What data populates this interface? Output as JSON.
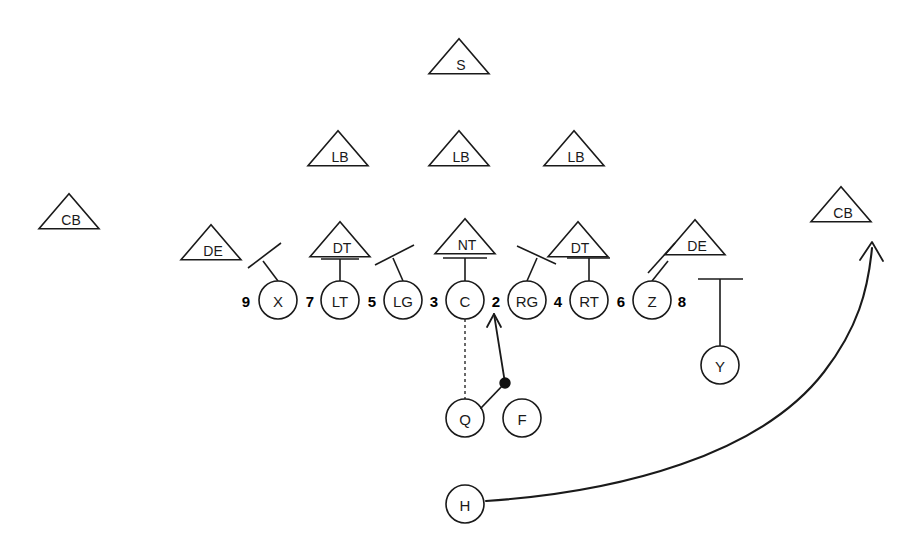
{
  "diagram": {
    "background_color": "#ffffff",
    "stroke_color": "#1a1a1a",
    "width": 924,
    "height": 550
  },
  "offense": {
    "shape": "circle",
    "players": [
      {
        "label": "X",
        "cx": 278,
        "cy": 300,
        "r": 19
      },
      {
        "label": "LT",
        "cx": 340,
        "cy": 300,
        "r": 19
      },
      {
        "label": "LG",
        "cx": 403,
        "cy": 300,
        "r": 19
      },
      {
        "label": "C",
        "cx": 465,
        "cy": 300,
        "r": 19
      },
      {
        "label": "RG",
        "cx": 527,
        "cy": 300,
        "r": 19
      },
      {
        "label": "RT",
        "cx": 589,
        "cy": 300,
        "r": 19
      },
      {
        "label": "Z",
        "cx": 652,
        "cy": 300,
        "r": 19
      },
      {
        "label": "Y",
        "cx": 720,
        "cy": 365,
        "r": 19
      },
      {
        "label": "Q",
        "cx": 465,
        "cy": 418,
        "r": 19
      },
      {
        "label": "F",
        "cx": 522,
        "cy": 418,
        "r": 19
      },
      {
        "label": "H",
        "cx": 465,
        "cy": 504,
        "r": 19
      }
    ]
  },
  "defense": {
    "shape": "triangle",
    "players": [
      {
        "label": "S",
        "cx": 459,
        "cy": 57,
        "half_width": 30,
        "height": 35
      },
      {
        "label": "LB",
        "cx": 338,
        "cy": 149,
        "half_width": 30,
        "height": 35
      },
      {
        "label": "LB",
        "cx": 459,
        "cy": 149,
        "half_width": 30,
        "height": 35
      },
      {
        "label": "LB",
        "cx": 574,
        "cy": 149,
        "half_width": 30,
        "height": 35
      },
      {
        "label": "CB",
        "cx": 69,
        "cy": 212,
        "half_width": 30,
        "height": 35
      },
      {
        "label": "CB",
        "cx": 841,
        "cy": 205,
        "half_width": 30,
        "height": 35
      },
      {
        "label": "DE",
        "cx": 211,
        "cy": 243,
        "half_width": 30,
        "height": 35
      },
      {
        "label": "DT",
        "cx": 340,
        "cy": 240,
        "half_width": 30,
        "height": 35
      },
      {
        "label": "NT",
        "cx": 465,
        "cy": 237,
        "half_width": 30,
        "height": 35
      },
      {
        "label": "DT",
        "cx": 578,
        "cy": 240,
        "half_width": 30,
        "height": 35
      },
      {
        "label": "DE",
        "cx": 695,
        "cy": 238,
        "half_width": 30,
        "height": 35
      }
    ]
  },
  "gaps": {
    "numbers": [
      {
        "label": "9",
        "x": 246,
        "y": 300
      },
      {
        "label": "7",
        "x": 310,
        "y": 300
      },
      {
        "label": "5",
        "x": 372,
        "y": 300
      },
      {
        "label": "3",
        "x": 434,
        "y": 300
      },
      {
        "label": "2",
        "x": 496,
        "y": 300
      },
      {
        "label": "4",
        "x": 558,
        "y": 300
      },
      {
        "label": "6",
        "x": 621,
        "y": 300
      },
      {
        "label": "8",
        "x": 682,
        "y": 300
      }
    ]
  },
  "blocking_assignments": [
    {
      "name": "x-block",
      "type": "angled-tee",
      "stem": [
        278,
        281,
        263,
        261
      ],
      "bar": [
        248,
        268,
        281,
        243
      ]
    },
    {
      "name": "lt-block",
      "type": "vertical-tee",
      "stem": [
        340,
        281,
        340,
        259
      ],
      "bar": [
        321,
        259,
        359,
        259
      ]
    },
    {
      "name": "lg-block",
      "type": "angled-tee",
      "stem": [
        403,
        281,
        393,
        258
      ],
      "bar": [
        375,
        265,
        414,
        245
      ]
    },
    {
      "name": "c-block",
      "type": "vertical-tee",
      "stem": [
        465,
        281,
        465,
        258
      ],
      "bar": [
        443,
        258,
        487,
        258
      ]
    },
    {
      "name": "rg-block",
      "type": "angled-tee",
      "stem": [
        527,
        281,
        537,
        258
      ],
      "bar": [
        517,
        246,
        556,
        264
      ]
    },
    {
      "name": "rt-block",
      "type": "vertical-tee",
      "stem": [
        589,
        281,
        589,
        258
      ],
      "bar": [
        567,
        258,
        610,
        258
      ]
    },
    {
      "name": "z-block",
      "type": "angled-tee",
      "stem": [
        652,
        281,
        668,
        261
      ],
      "bar": [
        675,
        243,
        648,
        273
      ]
    },
    {
      "name": "y-block",
      "type": "vertical-tee",
      "stem": [
        720,
        346,
        720,
        279
      ],
      "bar": [
        698,
        279,
        743,
        279
      ]
    }
  ],
  "ball_paths": {
    "snap": {
      "name": "center-to-qb-snap",
      "from": [
        465,
        319
      ],
      "to": [
        465,
        399
      ],
      "style": "dashed"
    },
    "handoff": {
      "name": "qb-to-fb-handoff",
      "from": [
        481,
        408
      ],
      "to": [
        505,
        383
      ],
      "style": "solid"
    },
    "run": {
      "name": "fullback-run-to-gap-2",
      "from": [
        505,
        383
      ],
      "to": [
        494,
        314
      ],
      "style": "solid-arrow"
    },
    "exchange_point": {
      "name": "handoff-point",
      "cx": 505,
      "cy": 383,
      "r": 5
    },
    "motion": {
      "name": "h-back-route",
      "start": [
        486,
        501
      ],
      "curve": "M 486 501 C 620 492, 760 455, 824 372 C 858 328, 868 290, 872 248",
      "arrow_tip": [
        872,
        242
      ],
      "style": "solid-curved-arrow"
    }
  },
  "legend": {
    "offense_symbol": "circle",
    "defense_symbol": "triangle",
    "gap_numbering": "odd-left-even-right"
  }
}
